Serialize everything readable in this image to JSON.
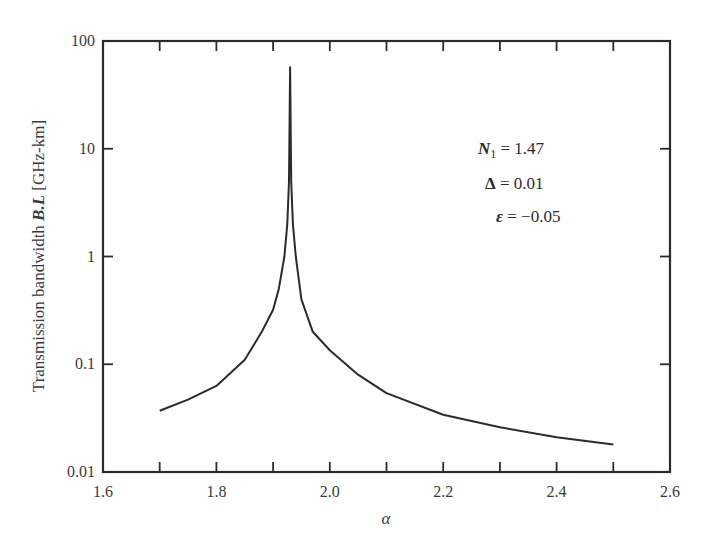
{
  "chart_data": {
    "type": "line",
    "title": "",
    "xlabel": "α",
    "ylabel_prefix": "Transmission bandwidth ",
    "ylabel_emph": "B.L",
    "ylabel_suffix": " [GHz-km]",
    "yscale": "log",
    "xlim": [
      1.6,
      2.6
    ],
    "ylim": [
      0.01,
      100
    ],
    "grid": false,
    "x_ticks": [
      1.6,
      1.8,
      2.0,
      2.2,
      2.4,
      2.6
    ],
    "x_tick_labels": [
      "1.6",
      "1.8",
      "2.0",
      "2.2",
      "2.4",
      "2.6"
    ],
    "x_minor_ticks": [
      1.7,
      1.9,
      2.1,
      2.3,
      2.5
    ],
    "y_ticks": [
      0.01,
      0.1,
      1,
      10,
      100
    ],
    "y_tick_labels": [
      "0.01",
      "0.1",
      "1",
      "10",
      "100"
    ],
    "series": [
      {
        "name": "B.L",
        "color": "#2b2b2b",
        "x": [
          1.7,
          1.75,
          1.8,
          1.85,
          1.88,
          1.9,
          1.91,
          1.92,
          1.925,
          1.928,
          1.93,
          1.932,
          1.935,
          1.94,
          1.95,
          1.97,
          2.0,
          2.05,
          2.1,
          2.2,
          2.3,
          2.4,
          2.5
        ],
        "y": [
          0.037,
          0.047,
          0.063,
          0.11,
          0.2,
          0.32,
          0.5,
          1.0,
          2.0,
          5.0,
          57,
          5.0,
          2.0,
          1.0,
          0.4,
          0.2,
          0.135,
          0.08,
          0.054,
          0.034,
          0.026,
          0.021,
          0.018
        ]
      }
    ],
    "annotations": [
      {
        "label": "N",
        "sub": "1",
        "text": " = 1.47"
      },
      {
        "label": "Δ",
        "sub": "",
        "text": " = 0.01"
      },
      {
        "label": "ε",
        "sub": "",
        "text": " = −0.05"
      }
    ],
    "legend": "none"
  }
}
